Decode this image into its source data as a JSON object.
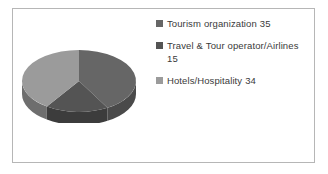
{
  "frame": {
    "border_color": "#b6b6b6",
    "background": "#ffffff"
  },
  "chart_data": {
    "type": "pie",
    "title": "",
    "subtitle": "",
    "xlabel": "",
    "ylabel": "",
    "three_d": true,
    "grid": false,
    "legend_position": "right",
    "total": 84,
    "categories": [
      "Tourism organization",
      "Travel & Tour operator/Airlines",
      "Hotels/Hospitality"
    ],
    "values": [
      35,
      15,
      34
    ],
    "labels": [
      "Tourism organization 35",
      "Travel & Tour operator/Airlines 15",
      "Hotels/Hospitality 34"
    ],
    "percentages": [
      "41.7%",
      "17.9%",
      "40.5%"
    ],
    "colors": [
      "#666666",
      "#545454",
      "#9b9b9b"
    ],
    "side_colors": [
      "#4a4a4a",
      "#3c3c3c",
      "#6e6e6e"
    ],
    "start_angle_deg": 0,
    "slices": [
      {
        "name": "Tourism organization",
        "value": 35,
        "color": "#666666",
        "side_color": "#4a4a4a",
        "start_deg": 0,
        "end_deg": 150
      },
      {
        "name": "Travel & Tour operator/Airlines",
        "value": 15,
        "color": "#545454",
        "side_color": "#3c3c3c",
        "start_deg": 150,
        "end_deg": 214.3
      },
      {
        "name": "Hotels/Hospitality",
        "value": 34,
        "color": "#9b9b9b",
        "side_color": "#6e6e6e",
        "start_deg": 214.3,
        "end_deg": 360
      }
    ]
  },
  "legend": {
    "items": [
      {
        "label": "Tourism organization 35",
        "swatch_color": "#666666"
      },
      {
        "label": "Travel & Tour operator/Airlines 15",
        "swatch_color": "#545454"
      },
      {
        "label": "Hotels/Hospitality 34",
        "swatch_color": "#9b9b9b"
      }
    ]
  }
}
